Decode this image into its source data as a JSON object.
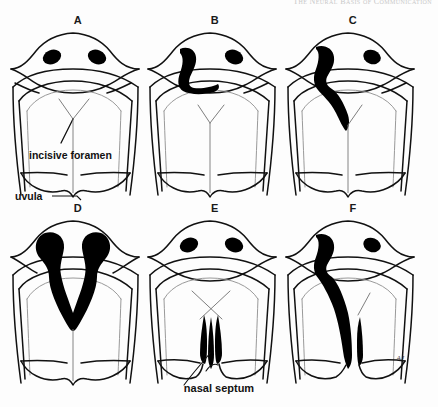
{
  "header": {
    "running_title": "The Neural Basis of Communication",
    "folio": ""
  },
  "figure": {
    "signature": "AJ",
    "panels": [
      {
        "id": "A",
        "letter": "A",
        "name": "normal-palate",
        "cleft_type": "none",
        "annotations": [
          {
            "name": "incisive-foramen",
            "text": "incisive foramen"
          },
          {
            "name": "uvula",
            "text": "uvula"
          }
        ]
      },
      {
        "id": "B",
        "letter": "B",
        "name": "unilateral-cleft-lip",
        "cleft_type": "unilateral-lip",
        "annotations": []
      },
      {
        "id": "C",
        "letter": "C",
        "name": "unilateral-cleft-lip-and-alveolus",
        "cleft_type": "unilateral-lip-alveolus",
        "annotations": []
      },
      {
        "id": "D",
        "letter": "D",
        "name": "bilateral-cleft-lip-and-alveolus",
        "cleft_type": "bilateral-lip-alveolus",
        "annotations": []
      },
      {
        "id": "E",
        "letter": "E",
        "name": "isolated-cleft-palate",
        "cleft_type": "palate-only",
        "annotations": [
          {
            "name": "nasal-septum",
            "text": "nasal septum"
          }
        ]
      },
      {
        "id": "F",
        "letter": "F",
        "name": "complete-unilateral-cleft-lip-and-palate",
        "cleft_type": "unilateral-complete",
        "annotations": []
      }
    ]
  },
  "colors": {
    "ink": "#111111",
    "cleft_fill": "#000000",
    "page_background": "#fdfdfd",
    "faint_line": "#9a9a9a"
  }
}
